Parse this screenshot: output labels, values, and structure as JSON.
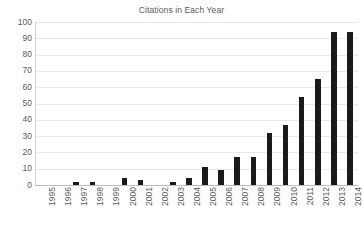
{
  "chart_data": {
    "type": "bar",
    "title": "Citations in Each Year",
    "xlabel": "",
    "ylabel": "",
    "categories": [
      "1995",
      "1996",
      "1997",
      "1998",
      "1999",
      "2000",
      "2001",
      "2002",
      "2003",
      "2004",
      "2005",
      "2006",
      "2007",
      "2008",
      "2009",
      "2010",
      "2011",
      "2012",
      "2013",
      "2014"
    ],
    "values": [
      0,
      0,
      2,
      2,
      0,
      4,
      3,
      0,
      2,
      4,
      11,
      9,
      17,
      17,
      32,
      37,
      54,
      65,
      94,
      94
    ],
    "ylim": [
      0,
      100
    ],
    "ytick_labels": [
      "100",
      "90",
      "80",
      "70",
      "60",
      "50",
      "40",
      "30",
      "20",
      "10",
      "0"
    ],
    "ytick_values": [
      100,
      90,
      80,
      70,
      60,
      50,
      40,
      30,
      20,
      10,
      0
    ],
    "grid": true,
    "legend": false,
    "legend_position": "none",
    "bar_color": "#1a1a1a",
    "gridline_color": "#e8e8e8",
    "text_color": "#5a5a5a",
    "background_color": "#ffffff"
  }
}
